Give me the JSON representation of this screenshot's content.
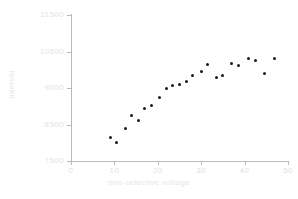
{
  "chart_data": {
    "type": "scatter",
    "title": "",
    "xlabel": "non-selective voltage",
    "ylabel": "interval",
    "xlim": [
      0,
      50
    ],
    "ylim": [
      7500,
      11500
    ],
    "xticks": [
      "0",
      "10",
      "20",
      "30",
      "40",
      "50"
    ],
    "xtick_values": [
      0,
      10,
      20,
      30,
      40,
      50
    ],
    "yticks": [
      "11500",
      "10500",
      "9500",
      "8500",
      "7500"
    ],
    "ytick_values": [
      11500,
      10500,
      9500,
      8500,
      7500
    ],
    "grid": false,
    "legend": null,
    "marker": "circle",
    "marker_color": "#1a1a1a",
    "points": [
      {
        "x": 9.0,
        "y": 8150
      },
      {
        "x": 10.5,
        "y": 8000
      },
      {
        "x": 12.5,
        "y": 8400
      },
      {
        "x": 14.0,
        "y": 8750
      },
      {
        "x": 15.5,
        "y": 8620
      },
      {
        "x": 17.0,
        "y": 8950
      },
      {
        "x": 18.5,
        "y": 9020
      },
      {
        "x": 20.5,
        "y": 9250
      },
      {
        "x": 22.0,
        "y": 9500
      },
      {
        "x": 23.5,
        "y": 9580
      },
      {
        "x": 25.0,
        "y": 9600
      },
      {
        "x": 26.5,
        "y": 9680
      },
      {
        "x": 28.0,
        "y": 9830
      },
      {
        "x": 30.0,
        "y": 9950
      },
      {
        "x": 31.5,
        "y": 10150
      },
      {
        "x": 33.5,
        "y": 9790
      },
      {
        "x": 35.0,
        "y": 9840
      },
      {
        "x": 37.0,
        "y": 10180
      },
      {
        "x": 38.5,
        "y": 10120
      },
      {
        "x": 41.0,
        "y": 10310
      },
      {
        "x": 42.5,
        "y": 10250
      },
      {
        "x": 44.5,
        "y": 9900
      },
      {
        "x": 47.0,
        "y": 10300
      }
    ]
  },
  "axis_colors": {
    "spine": "#b9b9b9",
    "tick_label": "#e3e3e3",
    "axis_title": "#e6e6e6",
    "marker": "#1a1a1a",
    "background": "#ffffff"
  }
}
